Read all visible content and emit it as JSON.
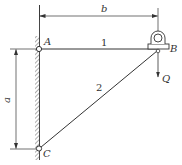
{
  "diagram": {
    "type": "truss-bracket",
    "points": {
      "A": {
        "label": "A",
        "x": 38,
        "y": 49
      },
      "B": {
        "label": "B",
        "x": 158,
        "y": 49
      },
      "C": {
        "label": "C",
        "x": 38,
        "y": 149
      }
    },
    "members": [
      {
        "id": "1",
        "label": "1",
        "from": "A",
        "to": "B"
      },
      {
        "id": "2",
        "label": "2",
        "from": "C",
        "to": "B"
      }
    ],
    "dimensions": {
      "horizontal": {
        "label": "b",
        "from": "A",
        "to": "B"
      },
      "vertical": {
        "label": "a",
        "from": "A",
        "to": "C"
      }
    },
    "load": {
      "label": "Q",
      "at": "B",
      "direction": "down"
    },
    "support": {
      "type": "wall",
      "side": "left"
    },
    "pulley": {
      "at": "B"
    },
    "colors": {
      "line": "#333333",
      "background": "#ffffff"
    }
  }
}
